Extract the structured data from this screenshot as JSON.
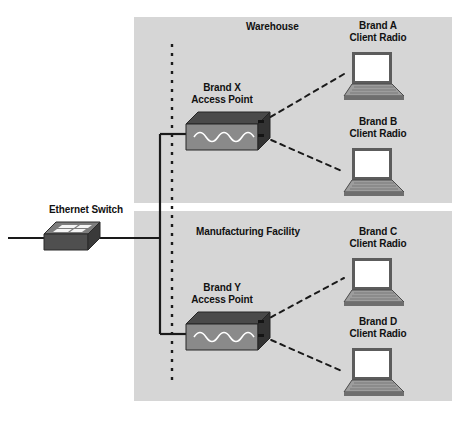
{
  "diagram": {
    "canvas": {
      "width": 466,
      "height": 422
    },
    "colors": {
      "zone_fill": "#d6d6d6",
      "page_background": "#ffffff",
      "line": "#1a1a1a",
      "device_top": "#4a4a4a",
      "device_front": "#808080",
      "device_side": "#3a3a3a",
      "switch_body": "#5a5a5a",
      "switch_top": "#6e6e6e",
      "laptop_screen": "#ffffff",
      "laptop_body": "#9a9a9a",
      "laptop_frame": "#5a5a5a",
      "text": "#111111"
    },
    "zones": [
      {
        "id": "warehouse",
        "label": "Warehouse",
        "x": 134,
        "y": 17,
        "width": 318,
        "height": 186,
        "label_x": 210,
        "label_y": 22
      },
      {
        "id": "manufacturing",
        "label": "Manufacturing Facility",
        "x": 134,
        "y": 211,
        "width": 318,
        "height": 190,
        "label_x": 188,
        "label_y": 226
      }
    ],
    "devices": [
      {
        "id": "ethernet-switch",
        "type": "switch",
        "label": "Ethernet Switch",
        "label_line1": "Ethernet Switch",
        "x": 44,
        "y": 226,
        "width": 56,
        "height": 24,
        "label_x": 40,
        "label_y": 206
      },
      {
        "id": "access-point-x",
        "type": "access-point",
        "label_line1": "Brand X",
        "label_line2": "Access Point",
        "x": 186,
        "y": 120,
        "width": 72,
        "height": 30,
        "label_x": 186,
        "label_y": 84
      },
      {
        "id": "access-point-y",
        "type": "access-point",
        "label_line1": "Brand Y",
        "label_line2": "Access Point",
        "x": 186,
        "y": 320,
        "width": 72,
        "height": 30,
        "label_x": 186,
        "label_y": 284
      },
      {
        "id": "client-radio-a",
        "type": "laptop",
        "label_line1": "Brand A",
        "label_line2": "Client Radio",
        "x": 350,
        "y": 52,
        "width": 52,
        "height": 44,
        "label_x": 346,
        "label_y": 22
      },
      {
        "id": "client-radio-b",
        "type": "laptop",
        "label_line1": "Brand B",
        "label_line2": "Client Radio",
        "x": 350,
        "y": 148,
        "width": 52,
        "height": 44,
        "label_x": 346,
        "label_y": 118
      },
      {
        "id": "client-radio-c",
        "type": "laptop",
        "label_line1": "Brand C",
        "label_line2": "Client Radio",
        "x": 350,
        "y": 258,
        "width": 52,
        "height": 44,
        "label_x": 346,
        "label_y": 228
      },
      {
        "id": "client-radio-d",
        "type": "laptop",
        "label_line1": "Brand D",
        "label_line2": "Client Radio",
        "x": 350,
        "y": 348,
        "width": 52,
        "height": 44,
        "label_x": 346,
        "label_y": 318
      }
    ],
    "connections": {
      "wired": [
        {
          "id": "switch-to-trunk",
          "from": "ethernet-switch",
          "to": "trunk",
          "style": "solid"
        },
        {
          "id": "trunk-to-ap-x",
          "from": "trunk",
          "to": "access-point-x",
          "style": "solid"
        },
        {
          "id": "trunk-to-ap-y",
          "from": "trunk",
          "to": "access-point-y",
          "style": "solid"
        }
      ],
      "wireless": [
        {
          "id": "ap-x-to-radio-a",
          "from": "access-point-x",
          "to": "client-radio-a",
          "style": "dashed"
        },
        {
          "id": "ap-x-to-radio-b",
          "from": "access-point-x",
          "to": "client-radio-b",
          "style": "dashed"
        },
        {
          "id": "ap-y-to-radio-c",
          "from": "access-point-y",
          "to": "client-radio-c",
          "style": "dashed"
        },
        {
          "id": "ap-y-to-radio-d",
          "from": "access-point-y",
          "to": "client-radio-d",
          "style": "dashed"
        }
      ],
      "boundary": {
        "id": "zone-boundary",
        "description": "vertical dotted boundary line",
        "style": "dotted",
        "x": 172,
        "y1": 44,
        "y2": 382
      }
    }
  }
}
